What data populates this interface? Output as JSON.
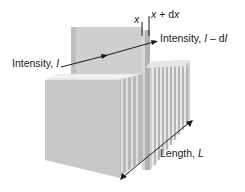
{
  "labels": {
    "intensity_in_prefix": "Intensity, ",
    "intensity_in_symbol": "I",
    "intensity_out_prefix": "Intensity, ",
    "intensity_out_symbol": "I",
    "intensity_out_minus": " – d",
    "intensity_out_symbol2": "I",
    "x": "x",
    "x_plus_dx_symbol": "x",
    "x_plus_dx_mid": " + d",
    "x_plus_dx_symbol2": "x",
    "length_prefix": "Length, ",
    "length_symbol": "L"
  },
  "colors": {
    "slab_front": "#c9c9c9",
    "slab_side": "#a8a8a8",
    "slab_top": "#e2e2e2",
    "slab_edge": "#f2f2f2",
    "arrow": "#1a1a1a",
    "back_panel": "#cfcfcf",
    "slice": "#b8b8b8"
  },
  "slices_count": 12
}
